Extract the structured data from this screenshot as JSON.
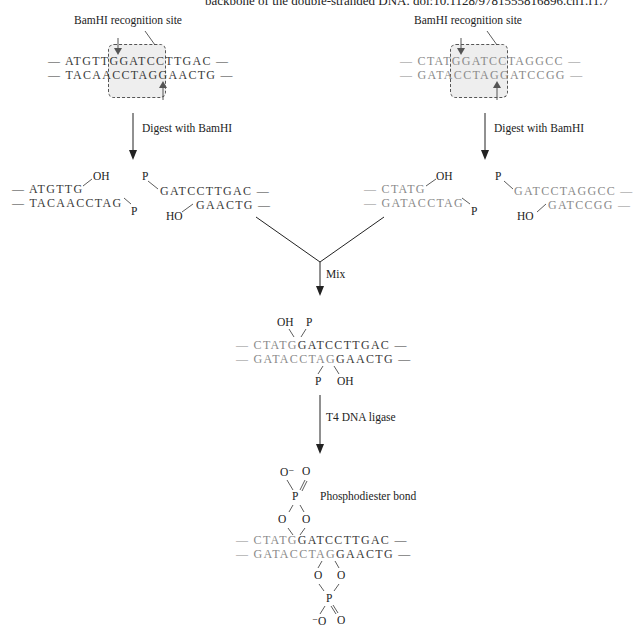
{
  "caption": "backbone of the double-stranded DNA. doi:10.1128/9781555816896.ch1.f1.7",
  "left_fragment": {
    "site_label": "BamHI recognition site",
    "top_strand": [
      "— ATGTT",
      "GGATCC",
      "TTGAC —"
    ],
    "bottom_strand": [
      "— TACAA",
      "CCTAGG",
      "AACTG —"
    ],
    "step": "Digest with BamHI",
    "cut_left_top": "— ATGTTG",
    "cut_left_bottom": "— TACAACCTAG",
    "cut_right_top": "GATCCTTGAC —",
    "cut_right_bottom": "GAACTG —",
    "oh": "OH",
    "p": "P",
    "ho": "HO"
  },
  "right_fragment": {
    "site_label": "BamHI recognition site",
    "top_strand": [
      "— CTAT",
      "GGATCC",
      "TAGGCC —"
    ],
    "bottom_strand": [
      "— GATA",
      "CCTAGG",
      "ATCCGG —"
    ],
    "step": "Digest with BamHI",
    "cut_left_top": "— CTATG",
    "cut_left_bottom": "— GATACCTAG",
    "cut_right_top": "GATCCTAGGCC —",
    "cut_right_bottom": "GATCCGG —",
    "oh": "OH",
    "p": "P",
    "ho": "HO"
  },
  "mix": {
    "step": "Mix",
    "top_gray": "— CTATG",
    "top_dark": "GATCCTTGAC —",
    "bottom_gray": "— GATACCTAG",
    "bottom_dark": "GAACTG —",
    "oh": "OH",
    "p": "P"
  },
  "ligase": {
    "step": "T4 DNA ligase",
    "bond_label": "Phosphodiester bond",
    "top_gray": "— CTATG",
    "top_dark": "GATCCTTGAC —",
    "bottom_gray": "— GATACCTAG",
    "bottom_dark": "GAACTG —",
    "o_minus": "O⁻",
    "o": "O",
    "p": "P",
    "minus_o": "⁻O"
  }
}
